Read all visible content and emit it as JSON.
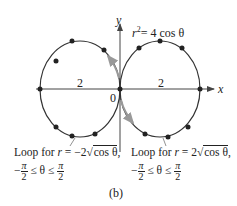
{
  "figure": {
    "caption": "(b)",
    "equation": {
      "lhs": "r",
      "exp": "2",
      "rhs": "= 4 cos θ"
    },
    "axes": {
      "x_label": "x",
      "y_label": "y",
      "origin_label": "0"
    },
    "loops": [
      {
        "id": "left",
        "radius_label": "2",
        "caption_line1_prefix": "Loop for ",
        "caption_line1_var": "r",
        "caption_line1_mid": " = −2",
        "caption_line1_sqrt": "cos θ",
        "caption_line1_suffix": ",",
        "range_minus": "−",
        "range_num": "π",
        "range_den": "2",
        "range_mid": " ≤ θ ≤ ",
        "range_num2": "π",
        "range_den2": "2"
      },
      {
        "id": "right",
        "radius_label": "2",
        "caption_line1_prefix": "Loop for ",
        "caption_line1_var": "r",
        "caption_line1_mid": " = 2",
        "caption_line1_sqrt": "cos θ",
        "caption_line1_suffix": ",",
        "range_minus": "−",
        "range_num": "π",
        "range_den": "2",
        "range_mid": " ≤ θ ≤ ",
        "range_num2": "π",
        "range_den2": "2"
      }
    ],
    "colors": {
      "curve": "#333333",
      "dot": "#222222",
      "arrow": "#999999",
      "axis": "#444444"
    }
  }
}
